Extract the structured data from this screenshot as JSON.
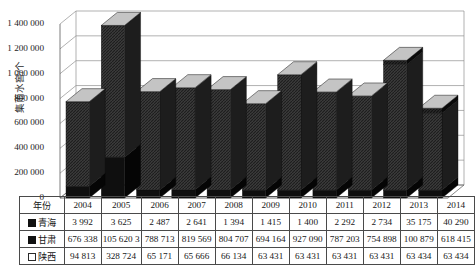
{
  "chart_data": {
    "type": "bar",
    "subtype": "stacked-column-3d",
    "title": "",
    "xlabel": "",
    "ylabel": "集雨水窖/个",
    "ylim": [
      0,
      1400000
    ],
    "ytick_step": 200000,
    "grid": true,
    "legend_position": "table-row-headers",
    "categories": [
      "2004",
      "2005",
      "2006",
      "2007",
      "2008",
      "2009",
      "2010",
      "2011",
      "2012",
      "2013",
      "2014"
    ],
    "series": [
      {
        "name": "青海",
        "marker": "solid-square",
        "values": [
          3992,
          3625,
          2487,
          2641,
          1394,
          1415,
          1400,
          2292,
          2734,
          35175,
          40290
        ]
      },
      {
        "name": "甘肃",
        "marker": "solid-square",
        "values": [
          676338,
          1056203,
          788713,
          819569,
          804707,
          694164,
          927090,
          787203,
          754898,
          1008790,
          618415
        ]
      },
      {
        "name": "陕西",
        "marker": "hollow-square",
        "values": [
          94813,
          328724,
          65171,
          65666,
          66134,
          63431,
          63431,
          63431,
          63431,
          63434,
          63434
        ]
      }
    ],
    "totals": [
      775143,
      1388552,
      856371,
      887876,
      872235,
      759010,
      991921,
      852926,
      821063,
      1107399,
      722139
    ],
    "ytick_labels": [
      "0",
      "200 000",
      "400 000",
      "600 000",
      "800 000",
      "1 000 000",
      "1 200 000",
      "1 400 000"
    ],
    "colors": {
      "qinghai": "#0d0d0d",
      "gansu": "#3a3a3a",
      "shaanxi": "#111111",
      "grid": "#8f8f8f",
      "axis": "#555555"
    }
  },
  "table": {
    "row_header_label": "年份",
    "columns": [
      "2004",
      "2005",
      "2006",
      "2007",
      "2008",
      "2009",
      "2010",
      "2011",
      "2012",
      "2013",
      "2014"
    ],
    "rows": [
      {
        "label": "青海",
        "marker": "solid",
        "cells": [
          "3 992",
          "3 625",
          "2 487",
          "2 641",
          "1 394",
          "1 415",
          "1 400",
          "2 292",
          "2 734",
          "35 175",
          "40 290"
        ]
      },
      {
        "label": "甘肃",
        "marker": "solid",
        "cells": [
          "676 338",
          "105 620 3",
          "788 713",
          "819 569",
          "804 707",
          "694 164",
          "927 090",
          "787 203",
          "754 898",
          "100 879",
          "618 415"
        ]
      },
      {
        "label": "陕西",
        "marker": "hollow",
        "cells": [
          "94 813",
          "328 724",
          "65 171",
          "65 666",
          "66 134",
          "63 431",
          "63 431",
          "63 431",
          "63 431",
          "63 434",
          "63 434"
        ]
      }
    ]
  }
}
